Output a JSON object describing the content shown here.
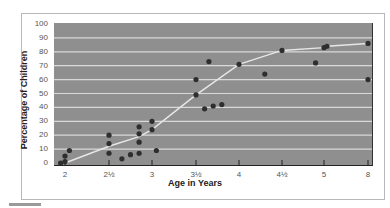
{
  "chart_data": {
    "type": "scatter",
    "title": "",
    "xlabel": "Age in Years",
    "ylabel": "Percentage of Children",
    "ylim": [
      0,
      100
    ],
    "y_ticks": [
      "0",
      "10",
      "20",
      "30",
      "40",
      "50",
      "60",
      "70",
      "80",
      "90",
      "100"
    ],
    "x_ticks": [
      "2",
      "2½",
      "3",
      "3½",
      "4",
      "4½",
      "5",
      "8"
    ],
    "grid": true,
    "legend": null,
    "series": [
      {
        "name": "Individual observations",
        "kind": "scatter",
        "points": [
          {
            "x": 1.95,
            "y": 0
          },
          {
            "x": 2.0,
            "y": 1
          },
          {
            "x": 2.0,
            "y": 5
          },
          {
            "x": 2.05,
            "y": 9
          },
          {
            "x": 2.5,
            "y": 20
          },
          {
            "x": 2.5,
            "y": 14
          },
          {
            "x": 2.5,
            "y": 7
          },
          {
            "x": 2.65,
            "y": 3
          },
          {
            "x": 2.75,
            "y": 6
          },
          {
            "x": 2.85,
            "y": 7
          },
          {
            "x": 2.85,
            "y": 15
          },
          {
            "x": 2.85,
            "y": 21
          },
          {
            "x": 2.85,
            "y": 26
          },
          {
            "x": 3.0,
            "y": 30
          },
          {
            "x": 3.0,
            "y": 24
          },
          {
            "x": 3.05,
            "y": 9
          },
          {
            "x": 3.5,
            "y": 60
          },
          {
            "x": 3.5,
            "y": 49
          },
          {
            "x": 3.6,
            "y": 39
          },
          {
            "x": 3.7,
            "y": 41
          },
          {
            "x": 3.8,
            "y": 42
          },
          {
            "x": 3.65,
            "y": 73
          },
          {
            "x": 4.0,
            "y": 71
          },
          {
            "x": 4.3,
            "y": 64
          },
          {
            "x": 4.5,
            "y": 81
          },
          {
            "x": 4.9,
            "y": 72
          },
          {
            "x": 5.0,
            "y": 83
          },
          {
            "x": 5.2,
            "y": 84
          },
          {
            "x": 8.0,
            "y": 86
          },
          {
            "x": 8.0,
            "y": 60
          }
        ]
      },
      {
        "name": "Trend line",
        "kind": "line",
        "points": [
          {
            "x": 2.0,
            "y": 0
          },
          {
            "x": 2.5,
            "y": 12
          },
          {
            "x": 2.85,
            "y": 19
          },
          {
            "x": 3.0,
            "y": 24
          },
          {
            "x": 3.5,
            "y": 49
          },
          {
            "x": 4.0,
            "y": 71
          },
          {
            "x": 4.5,
            "y": 81
          },
          {
            "x": 5.0,
            "y": 83
          },
          {
            "x": 5.2,
            "y": 84
          },
          {
            "x": 8.0,
            "y": 86
          }
        ]
      }
    ]
  },
  "pixel_map": {
    "x_positions": {
      "2": 65,
      "2½": 109,
      "3": 152,
      "3½": 196,
      "4": 239,
      "4½": 282,
      "5": 324,
      "8": 368
    },
    "y_zero": 163,
    "y_per_unit": 1.39
  },
  "colors": {
    "plot_background": "#8f8f8f",
    "gridline": "#d9d9d9",
    "point": "#2e2e2e",
    "trend_line": "#e6e6e6",
    "frame": "#b8b8b8"
  }
}
